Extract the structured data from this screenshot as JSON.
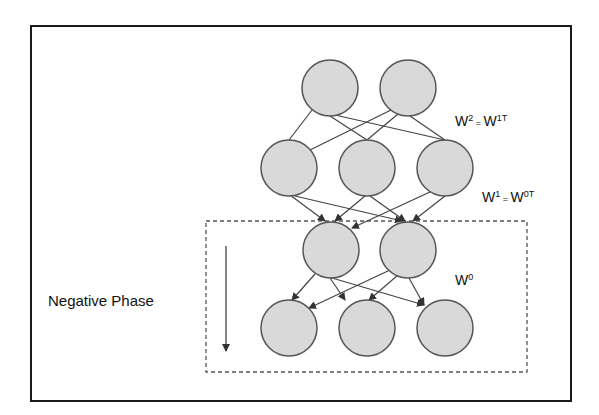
{
  "diagram": {
    "title": "Negative Phase",
    "colors": {
      "frame": "#1a1a1a",
      "node_fill": "#d9d9d9",
      "node_stroke": "#555555",
      "edge": "#444444",
      "dashed_box": "#555555"
    },
    "layers": [
      {
        "name": "top",
        "nodes": [
          [
            330,
            88
          ],
          [
            408,
            88
          ]
        ]
      },
      {
        "name": "hidden-2",
        "nodes": [
          [
            289,
            168
          ],
          [
            367,
            168
          ],
          [
            445,
            168
          ]
        ]
      },
      {
        "name": "hidden-1",
        "nodes": [
          [
            331,
            250
          ],
          [
            408,
            250
          ]
        ]
      },
      {
        "name": "visible",
        "nodes": [
          [
            289,
            328
          ],
          [
            367,
            328
          ],
          [
            445,
            328
          ]
        ]
      }
    ],
    "weights": [
      {
        "base": "W",
        "sup1": "2",
        "eq": "=",
        "base2": "W",
        "sup2": "1T",
        "x": 455,
        "y": 126
      },
      {
        "base": "W",
        "sup1": "1",
        "eq": "=",
        "base2": "W",
        "sup2": "0T",
        "x": 482,
        "y": 202
      },
      {
        "base": "W",
        "sup1": "0",
        "x": 455,
        "y": 285
      }
    ],
    "labels": {
      "phase": "Negative Phase",
      "w2": "W",
      "w2_sup": "2",
      "w2_eq": " = ",
      "w2_rhs": "W",
      "w2_rhs_sup": "1T",
      "w1": "W",
      "w1_sup": "1",
      "w1_eq": " = ",
      "w1_rhs": "W",
      "w1_rhs_sup": "0T",
      "w0": "W",
      "w0_sup": "0"
    }
  }
}
